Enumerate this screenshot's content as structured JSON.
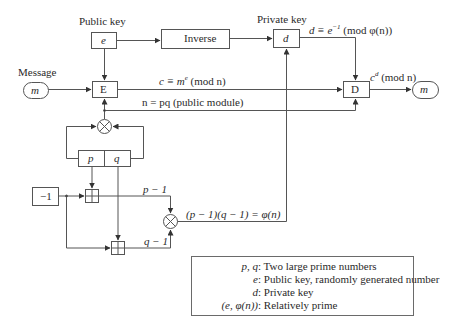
{
  "diagram": {
    "labels": {
      "public_key": "Public key",
      "private_key": "Private key",
      "message": "Message"
    },
    "boxes": {
      "e": "e",
      "inverse": "Inverse",
      "d": "d",
      "encrypt": "E",
      "decrypt": "D",
      "p": "p",
      "q": "q",
      "minus_one": "−1",
      "message_in": "m",
      "message_out": "m"
    },
    "formulas": {
      "d_def_prefix": "d ≡ e",
      "d_def_sup": "−1",
      "d_def_suffix": " (mod φ(n))",
      "cipher_prefix": "c ≡ m",
      "cipher_sup": "e",
      "cipher_suffix": " (mod n)",
      "modulus": "n = pq (public module)",
      "decrypt_prefix": "c",
      "decrypt_sup": "d",
      "decrypt_suffix": " (mod n)",
      "p_minus_1": "p − 1",
      "q_minus_1": "q − 1",
      "phi": "(p − 1)(q − 1) = φ(n)"
    },
    "operators": {
      "multiply": "⊗",
      "add": "⊞"
    },
    "legend": [
      {
        "key": "p, q",
        "value": "Two large prime numbers"
      },
      {
        "key": "e",
        "value": "Public key, randomly generated number"
      },
      {
        "key": "d",
        "value": "Private key"
      },
      {
        "key": "(e, φ(n))",
        "value": "Relatively prime"
      }
    ],
    "colors": {
      "line": "#4a4a4a",
      "text": "#2a2a2a",
      "background": "#ffffff"
    }
  }
}
